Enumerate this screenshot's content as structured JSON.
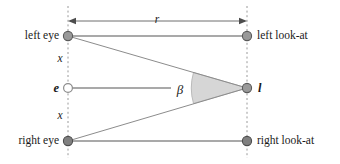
{
  "diagram": {
    "colors": {
      "background": "#ffffff",
      "node_fill": "#999999",
      "node_stroke": "#5a5a5a",
      "open_node_fill": "#ffffff",
      "line": "#8c8c8c",
      "ray_line": "#8c8c8c",
      "dashed_guide": "#9a9a9a",
      "wedge_fill": "#d6d6d6",
      "wedge_stroke": "#a8a8a8",
      "text": "#1a1a1a",
      "arrow": "#6e6e6e"
    },
    "labels": {
      "left_eye": "left eye",
      "right_eye": "right eye",
      "left_look_at": "left look-at",
      "right_look_at": "right look-at",
      "eye_point": "e",
      "look_at_point": "l",
      "distance_r": "r",
      "offset_upper": "x",
      "offset_lower": "x",
      "angle_beta": "β"
    },
    "nodes": [
      {
        "name": "left-eye-node",
        "x": 68,
        "y": 36,
        "style": "filled"
      },
      {
        "name": "left-look-at-node",
        "x": 247,
        "y": 36,
        "style": "filled"
      },
      {
        "name": "eye-center-node",
        "x": 68,
        "y": 88,
        "style": "open"
      },
      {
        "name": "look-at-node",
        "x": 247,
        "y": 88,
        "style": "filled"
      },
      {
        "name": "right-eye-node",
        "x": 68,
        "y": 141,
        "style": "filled"
      },
      {
        "name": "right-look-at-node",
        "x": 247,
        "y": 141,
        "style": "filled"
      }
    ],
    "guides": [
      {
        "name": "left-vertical-guide",
        "x": 68,
        "y1": 6,
        "y2": 158
      },
      {
        "name": "right-vertical-guide",
        "x": 247,
        "y1": 6,
        "y2": 158
      }
    ],
    "measure": {
      "name": "r-dimension-arrow",
      "x1": 68,
      "x2": 247,
      "y": 21
    }
  }
}
